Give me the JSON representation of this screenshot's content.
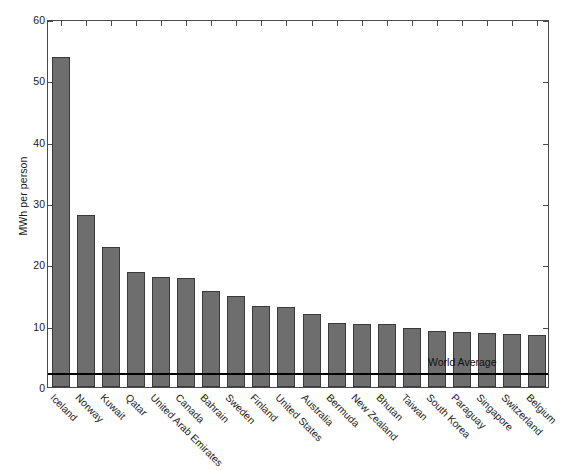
{
  "chart_data": {
    "type": "bar",
    "title": "",
    "subtitle": "",
    "xlabel": "",
    "ylabel": "MWh per person",
    "ylim": [
      0,
      60
    ],
    "yticks": [
      0,
      10,
      20,
      30,
      40,
      50,
      60
    ],
    "ytick_labels": [
      "0",
      "10",
      "20",
      "30",
      "40",
      "50",
      "60"
    ],
    "grid": false,
    "legend": null,
    "bar_color": "#6e6e6e",
    "bar_edge_color": "#3a3a3a",
    "axis_color": "#4a4a4a",
    "categories": [
      "Iceland",
      "Norway",
      "Kuwait",
      "Qatar",
      "United Arab Emirates",
      "Canada",
      "Bahrain",
      "Sweden",
      "Finland",
      "United States",
      "Australia",
      "Bermuda",
      "New Zealand",
      "Bhutan",
      "Taiwan",
      "South Korea",
      "Paraguay",
      "Singapore",
      "Switzerland",
      "Belgium"
    ],
    "values": [
      53.8,
      28.0,
      22.9,
      18.7,
      17.9,
      17.8,
      15.7,
      14.8,
      13.2,
      13.1,
      11.9,
      10.5,
      10.3,
      10.2,
      9.6,
      9.1,
      9.0,
      8.8,
      8.7,
      8.5
    ],
    "annotations": [
      {
        "name": "world-average",
        "label": "World Average",
        "value": 2.6,
        "line_color": "#000000"
      }
    ]
  }
}
